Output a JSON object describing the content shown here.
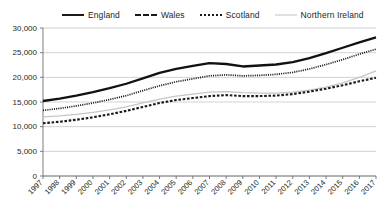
{
  "legend": {
    "position": "top",
    "entries": [
      {
        "label": "England",
        "style": "solid-thick",
        "color": "#111111"
      },
      {
        "label": "Wales",
        "style": "dashed",
        "color": "#1a1a1a"
      },
      {
        "label": "Scotland",
        "style": "dotted",
        "color": "#1a1a1a"
      },
      {
        "label": "Northern Ireland",
        "style": "solid-thin",
        "color": "#c6c6c6"
      }
    ]
  },
  "chart_data": {
    "type": "line",
    "title": "",
    "xlabel": "",
    "ylabel": "",
    "grid": true,
    "legend_position": "top",
    "ylim": [
      0,
      30000
    ],
    "yticks": [
      0,
      5000,
      10000,
      15000,
      20000,
      25000,
      30000
    ],
    "ytick_labels": [
      "0",
      "5,000",
      "10,000",
      "15,000",
      "20,000",
      "25,000",
      "30,000"
    ],
    "categories": [
      "1997",
      "1998",
      "1999",
      "2000",
      "2001",
      "2002",
      "2003",
      "2004",
      "2005",
      "2006",
      "2007",
      "2008",
      "2009",
      "2010",
      "2011",
      "2012",
      "2013",
      "2014",
      "2015",
      "2016",
      "2017"
    ],
    "series": [
      {
        "name": "England",
        "values": [
          15200,
          15700,
          16300,
          17000,
          17800,
          18700,
          19800,
          20900,
          21700,
          22300,
          22900,
          22700,
          22200,
          22400,
          22600,
          23100,
          23900,
          24900,
          26000,
          27100,
          28100
        ]
      },
      {
        "name": "Wales",
        "values": [
          10700,
          11000,
          11400,
          11900,
          12500,
          13200,
          14000,
          14800,
          15400,
          15800,
          16200,
          16400,
          16200,
          16200,
          16300,
          16600,
          17100,
          17700,
          18400,
          19200,
          19900
        ]
      },
      {
        "name": "Scotland",
        "values": [
          13300,
          13700,
          14200,
          14800,
          15500,
          16300,
          17300,
          18300,
          19100,
          19700,
          20300,
          20500,
          20300,
          20400,
          20600,
          21000,
          21700,
          22600,
          23600,
          24700,
          25700
        ]
      },
      {
        "name": "Northern Ireland",
        "values": [
          12000,
          12200,
          12500,
          12900,
          13400,
          14000,
          14800,
          15600,
          16200,
          16600,
          17000,
          17100,
          16900,
          16800,
          16800,
          17000,
          17400,
          18000,
          18900,
          20000,
          21300
        ]
      }
    ]
  }
}
